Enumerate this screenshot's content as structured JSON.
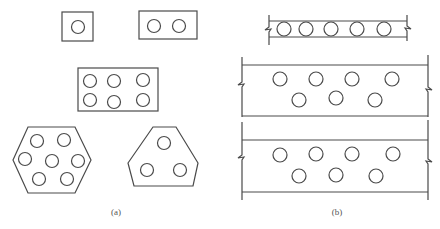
{
  "figure": {
    "panel_a": {
      "label": "(a)",
      "shapes": [
        {
          "name": "single-bar-square",
          "type": "rect",
          "x": 62,
          "y": 12,
          "w": 31,
          "h": 29,
          "circles": [
            [
              78,
              27
            ]
          ]
        },
        {
          "name": "double-bar-rect",
          "type": "rect",
          "x": 139,
          "y": 11,
          "w": 58,
          "h": 28,
          "circles": [
            [
              154,
              26
            ],
            [
              179,
              26
            ]
          ]
        },
        {
          "name": "six-bar-rect",
          "type": "rect",
          "x": 78,
          "y": 68,
          "w": 80,
          "h": 43,
          "circles": [
            [
              90,
              81
            ],
            [
              114,
              81
            ],
            [
              143,
              80
            ],
            [
              90,
              100
            ],
            [
              114,
              102
            ],
            [
              143,
              100
            ]
          ]
        },
        {
          "name": "seven-bar-hexagon",
          "type": "polygon",
          "points": "28,127 75,127 91,160 75,193 28,193 13,160",
          "circles": [
            [
              37,
              141
            ],
            [
              64,
              140
            ],
            [
              25,
              159
            ],
            [
              52,
              161
            ],
            [
              78,
              161
            ],
            [
              39,
              179
            ],
            [
              67,
              179
            ]
          ]
        },
        {
          "name": "three-bar-truncated-triangle",
          "type": "polygon",
          "points": "153,127 176,127 198,163 193,186 134,186 128,163",
          "circles": [
            [
              164,
              143
            ],
            [
              147,
              170
            ],
            [
              180,
              170
            ]
          ]
        }
      ],
      "circle_radius": 6.5
    },
    "panel_b": {
      "label": "(b)",
      "slabs": [
        {
          "name": "thin-slab",
          "top": 21,
          "bottom": 37,
          "left": 269,
          "right": 407,
          "vlines": {
            "left": [
              15,
              45
            ],
            "right": [
              15,
              41
            ]
          },
          "breaks": {
            "left": 29,
            "right": 28
          },
          "circles": [
            [
              284,
              29
            ],
            [
              306,
              29
            ],
            [
              331,
              29
            ],
            [
              357,
              29
            ],
            [
              384,
              29
            ]
          ],
          "r": 7
        },
        {
          "name": "thick-slab-upper",
          "top": 65,
          "bottom": 116,
          "left": 242,
          "right": 428,
          "vlines": {
            "left": [
              57,
              117
            ],
            "right": [
              55,
              117
            ]
          },
          "breaks": {
            "left": 84,
            "right": 89
          },
          "circles": [
            [
              280,
              79
            ],
            [
              316,
              79
            ],
            [
              352,
              79
            ],
            [
              392,
              79
            ],
            [
              299,
              100
            ],
            [
              336,
              98
            ],
            [
              375,
              100
            ]
          ],
          "r": 7
        },
        {
          "name": "thick-slab-lower",
          "top": 140,
          "bottom": 192,
          "left": 242,
          "right": 428,
          "vlines": {
            "left": [
              122,
              200
            ],
            "right": [
              120,
              200
            ]
          },
          "breaks": {
            "left": 157,
            "right": 161
          },
          "circles": [
            [
              280,
              155
            ],
            [
              316,
              154
            ],
            [
              352,
              154
            ],
            [
              393,
              154
            ],
            [
              299,
              176
            ],
            [
              336,
              175
            ],
            [
              376,
              176
            ]
          ],
          "r": 7
        }
      ]
    }
  }
}
